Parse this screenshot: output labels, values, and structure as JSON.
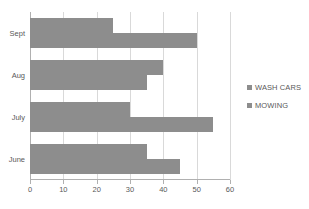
{
  "chart_data": {
    "type": "bar",
    "orientation": "horizontal",
    "title": "",
    "xlabel": "",
    "ylabel": "",
    "categories": [
      "Sept",
      "Aug",
      "July",
      "June"
    ],
    "series": [
      {
        "name": "WASH CARS",
        "values": [
          25,
          40,
          30,
          35
        ],
        "color": "#8d8d8d"
      },
      {
        "name": "MOWING",
        "values": [
          50,
          35,
          55,
          45
        ],
        "color": "#8d8d8d"
      }
    ],
    "xlim": [
      0,
      60
    ],
    "xticks": [
      0,
      10,
      20,
      30,
      40,
      50,
      60
    ],
    "xtick_labels": [
      "0",
      "10",
      "20",
      "30",
      "40",
      "50",
      "60"
    ],
    "grid": true,
    "grid_axis": "x",
    "legend_position": "right",
    "legend": [
      "WASH CARS",
      "MOWING"
    ]
  },
  "axes": {
    "category_labels": [
      "Sept",
      "Aug",
      "July",
      "June"
    ],
    "tick_labels": [
      "0",
      "10",
      "20",
      "30",
      "40",
      "50",
      "60"
    ]
  },
  "legend": {
    "items": [
      {
        "label": "WASH CARS"
      },
      {
        "label": "MOWING"
      }
    ]
  },
  "colors": {
    "bar": "#8d8d8d",
    "grid": "#d9d9d9",
    "axis": "#b0b0b0",
    "text": "#595959",
    "background": "#ffffff"
  }
}
